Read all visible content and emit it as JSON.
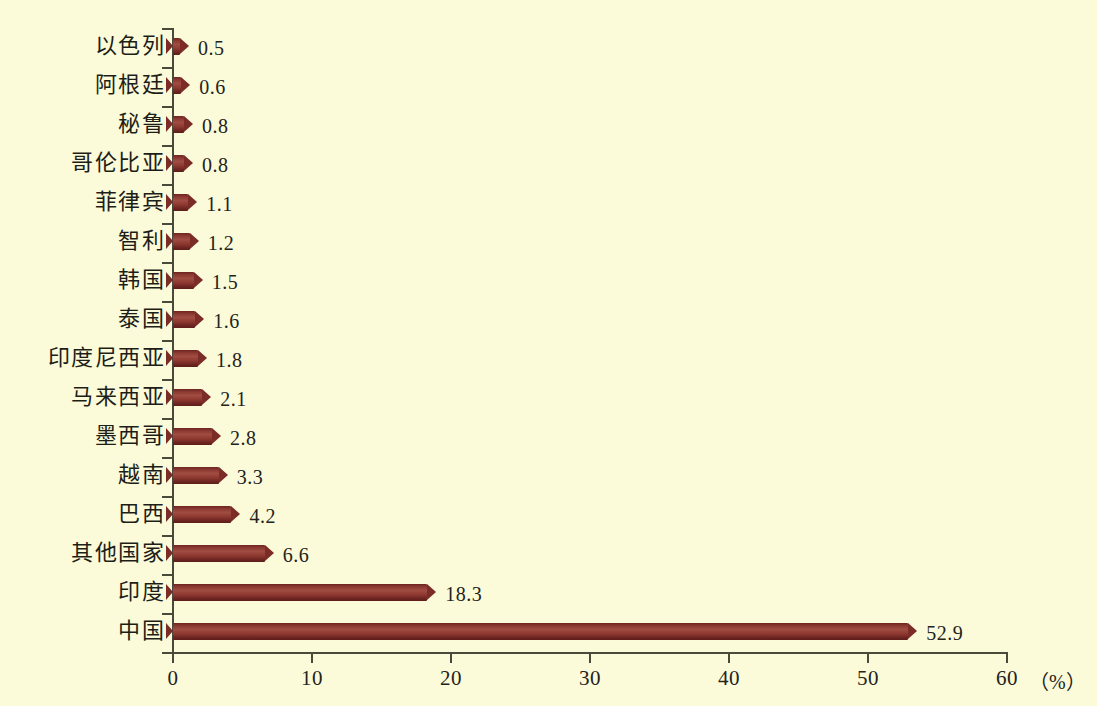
{
  "chart_data": {
    "type": "bar",
    "orientation": "horizontal",
    "title": "",
    "subtitle": "",
    "xlabel": "（%）",
    "ylabel": "",
    "xlim": [
      0,
      60
    ],
    "x_ticks": [
      "0",
      "10",
      "20",
      "30",
      "40",
      "50",
      "60"
    ],
    "x_tick_values": [
      0,
      10,
      20,
      30,
      40,
      50,
      60
    ],
    "grid": false,
    "legend": null,
    "unit_suffix": "（%）",
    "bar_color": "#8d3b33",
    "background_color": "#fbfbd9",
    "axis_color": "#4a4a3c",
    "categories": [
      "以色列",
      "阿根廷",
      "秘鲁",
      "哥伦比亚",
      "菲律宾",
      "智利",
      "韩国",
      "泰国",
      "印度尼西亚",
      "马来西亚",
      "墨西哥",
      "越南",
      "巴西",
      "其他国家",
      "印度",
      "中国"
    ],
    "values": [
      0.5,
      0.6,
      0.8,
      0.8,
      1.1,
      1.2,
      1.5,
      1.6,
      1.8,
      2.1,
      2.8,
      3.3,
      4.2,
      6.6,
      18.3,
      52.9
    ],
    "value_labels": [
      "0.5",
      "0.6",
      "0.8",
      "0.8",
      "1.1",
      "1.2",
      "1.5",
      "1.6",
      "1.8",
      "2.1",
      "2.8",
      "3.3",
      "4.2",
      "6.6",
      "18.3",
      "52.9"
    ]
  }
}
